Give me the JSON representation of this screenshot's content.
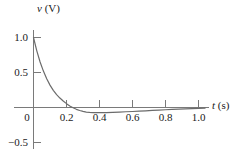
{
  "figure": {
    "background_color": "#ffffff",
    "line_color": "#6b6b6b",
    "axis_color": "#7a7a7a",
    "text_color": "#1a1a1a"
  },
  "labels": {
    "y_axis_variable": "v",
    "y_axis_unit": "(V)",
    "x_axis_variable": "t",
    "x_axis_unit": "(s)"
  },
  "y_ticks": [
    {
      "value": 1.0,
      "label": "1.0"
    },
    {
      "value": 0.5,
      "label": "0.5"
    },
    {
      "value": 0.0,
      "label": "0"
    },
    {
      "value": -0.5,
      "label": "−0.5"
    }
  ],
  "x_ticks": [
    {
      "value": 0.2,
      "label": "0.2"
    },
    {
      "value": 0.4,
      "label": "0.4"
    },
    {
      "value": 0.6,
      "label": "0.6"
    },
    {
      "value": 0.8,
      "label": "0.8"
    },
    {
      "value": 1.0,
      "label": "1.0"
    }
  ],
  "chart_data": {
    "type": "line",
    "title": "",
    "subtitle": "",
    "xlabel": "t (s)",
    "ylabel": "v (V)",
    "xlim": [
      0.0,
      1.08
    ],
    "ylim": [
      -0.5,
      1.0
    ],
    "xtick_labels": [
      "0",
      "0.2",
      "0.4",
      "0.6",
      "0.8",
      "1.0"
    ],
    "ytick_labels": [
      "−0.5",
      "0",
      "0.5",
      "1.0"
    ],
    "grid": false,
    "legend": false,
    "legend_position": "none",
    "zero_crossing_t": 0.21,
    "minimum_point": {
      "t": 0.4,
      "v": -0.07
    },
    "annotations": [],
    "series": [
      {
        "name": "v(t)",
        "color": "#6b6b6b",
        "x": [
          0.0,
          0.02,
          0.04,
          0.06,
          0.08,
          0.1,
          0.12,
          0.14,
          0.16,
          0.18,
          0.2,
          0.22,
          0.24,
          0.26,
          0.28,
          0.3,
          0.32,
          0.34,
          0.36,
          0.38,
          0.4,
          0.44,
          0.48,
          0.52,
          0.56,
          0.6,
          0.64,
          0.68,
          0.72,
          0.76,
          0.8,
          0.84,
          0.88,
          0.92,
          0.96,
          1.0,
          1.04
        ],
        "values": [
          1.0,
          0.81,
          0.65,
          0.52,
          0.41,
          0.32,
          0.245,
          0.185,
          0.135,
          0.092,
          0.055,
          0.022,
          -0.004,
          -0.026,
          -0.043,
          -0.056,
          -0.065,
          -0.07,
          -0.073,
          -0.074,
          -0.074,
          -0.072,
          -0.069,
          -0.065,
          -0.061,
          -0.057,
          -0.052,
          -0.047,
          -0.042,
          -0.037,
          -0.032,
          -0.028,
          -0.024,
          -0.02,
          -0.016,
          -0.012,
          -0.009
        ]
      }
    ]
  }
}
